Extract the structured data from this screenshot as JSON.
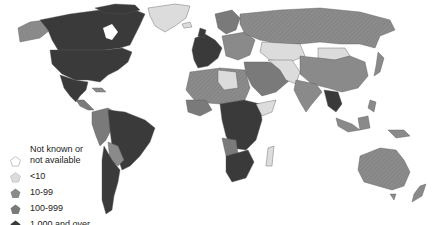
{
  "map": {
    "type": "choropleth",
    "region": "World",
    "colors": {
      "not_known": "#ffffff",
      "lt10": "#dcdcdc",
      "10_99": "#8a8a8a",
      "100_999": "#7a7a7a",
      "1000_plus": "#3a3a3a",
      "border": "#555555"
    }
  },
  "legend": {
    "items": [
      {
        "label_line1": "Not known or",
        "label_line2": "not available",
        "color": "#ffffff"
      },
      {
        "label": "<10",
        "color": "#dcdcdc"
      },
      {
        "label": "10-99",
        "color": "#8a8a8a"
      },
      {
        "label": "100-999",
        "color": "#7a7a7a"
      },
      {
        "label": "1,000 and over",
        "color": "#3a3a3a"
      }
    ]
  }
}
